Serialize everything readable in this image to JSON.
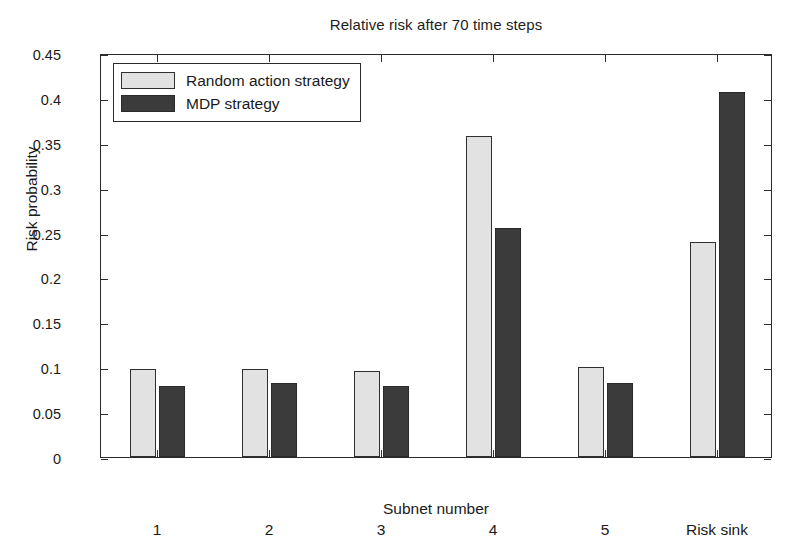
{
  "chart_data": {
    "type": "bar",
    "title": "Relative risk after 70 time steps",
    "xlabel": "Subnet number",
    "ylabel": "Risk probability",
    "categories": [
      "1",
      "2",
      "3",
      "4",
      "5",
      "Risk sink"
    ],
    "series": [
      {
        "name": "Random action strategy",
        "color": "#e2e2e2",
        "values": [
          0.098,
          0.098,
          0.0955,
          0.358,
          0.1,
          0.239
        ]
      },
      {
        "name": "MDP strategy",
        "color": "#3b3b3b",
        "values": [
          0.079,
          0.083,
          0.079,
          0.255,
          0.082,
          0.407
        ]
      }
    ],
    "ylim": [
      0,
      0.45
    ],
    "ytick_labels": [
      "0",
      "0.05",
      "0.1",
      "0.15",
      "0.2",
      "0.25",
      "0.3",
      "0.35",
      "0.4",
      "0.45"
    ],
    "ytick_values": [
      0,
      0.05,
      0.1,
      0.15,
      0.2,
      0.25,
      0.3,
      0.35,
      0.4,
      0.45
    ],
    "grid": false,
    "legend_position": "top-left"
  },
  "legend": {
    "entries": [
      {
        "label": "Random action strategy",
        "swatch": "light"
      },
      {
        "label": "MDP strategy",
        "swatch": "dark"
      }
    ]
  }
}
